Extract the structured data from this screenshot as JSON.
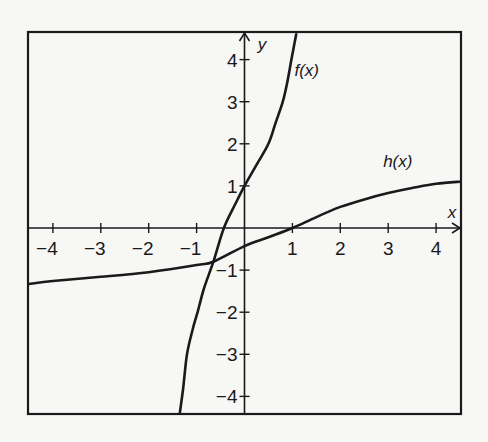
{
  "chart_data": {
    "type": "line",
    "title": "",
    "xlabel": "x",
    "ylabel": "y",
    "xlim": [
      -4.5,
      4.5
    ],
    "ylim": [
      -4.4,
      4.6
    ],
    "grid": false,
    "legend": "none (inline curve labels)",
    "x_ticks": [
      -4,
      -3,
      -2,
      -1,
      1,
      2,
      3,
      4
    ],
    "x_tick_labels": [
      "−4",
      "−3",
      "−2",
      "−1",
      "1",
      "2",
      "3",
      "4"
    ],
    "y_ticks": [
      4,
      3,
      2,
      1,
      -1,
      -2,
      -3,
      -4
    ],
    "y_tick_labels": [
      "4",
      "3",
      "2",
      "1",
      "−1",
      "−2",
      "−3",
      "−4"
    ],
    "series": [
      {
        "name": "f(x)",
        "label": "f(x)",
        "label_pos": [
          1.3,
          3.6
        ],
        "points": [
          [
            -1.35,
            -4.4
          ],
          [
            -1.28,
            -3.8
          ],
          [
            -1.2,
            -3.0
          ],
          [
            -1.08,
            -2.4
          ],
          [
            -0.98,
            -2.0
          ],
          [
            -0.85,
            -1.45
          ],
          [
            -0.65,
            -0.8
          ],
          [
            -0.43,
            0.0
          ],
          [
            -0.2,
            0.55
          ],
          [
            0.0,
            1.0
          ],
          [
            0.25,
            1.5
          ],
          [
            0.5,
            2.0
          ],
          [
            0.65,
            2.5
          ],
          [
            0.8,
            3.0
          ],
          [
            0.9,
            3.5
          ],
          [
            0.98,
            4.0
          ],
          [
            1.08,
            4.6
          ]
        ]
      },
      {
        "name": "h(x)",
        "label": "h(x)",
        "label_pos": [
          3.2,
          1.45
        ],
        "points": [
          [
            -4.5,
            -1.33
          ],
          [
            -4.0,
            -1.26
          ],
          [
            -3.0,
            -1.16
          ],
          [
            -2.0,
            -1.05
          ],
          [
            -1.0,
            -0.88
          ],
          [
            -0.65,
            -0.8
          ],
          [
            0.0,
            -0.43
          ],
          [
            0.5,
            -0.22
          ],
          [
            1.0,
            0.0
          ],
          [
            1.5,
            0.26
          ],
          [
            2.0,
            0.5
          ],
          [
            2.5,
            0.68
          ],
          [
            3.0,
            0.83
          ],
          [
            3.5,
            0.95
          ],
          [
            4.0,
            1.05
          ],
          [
            4.5,
            1.1
          ]
        ]
      }
    ],
    "annotations": [
      "curves intersect near (-0.65, -0.8)",
      "f(0) = 1",
      "h(1) = 0"
    ]
  },
  "axes": {
    "x_label": "x",
    "y_label": "y"
  },
  "colors": {
    "ink": "#1a1a1a",
    "background": "#f7f7f5"
  }
}
